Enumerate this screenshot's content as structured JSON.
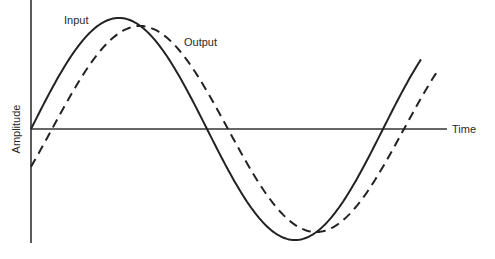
{
  "chart_data": {
    "type": "line",
    "title": "",
    "xlabel": "Time",
    "ylabel": "Amplitude",
    "grid": false,
    "legend": "inline labels",
    "series": [
      {
        "name": "Input",
        "style": "solid",
        "amplitude": 1.0,
        "phase_shift": 0.0,
        "x_deg": [
          0,
          90,
          180,
          270,
          450
        ],
        "y": [
          0,
          1,
          0,
          -1,
          0.67
        ]
      },
      {
        "name": "Output",
        "style": "dashed",
        "amplitude": 0.93,
        "phase_shift_deg": 21,
        "x_deg": [
          0,
          111,
          201,
          291,
          468
        ],
        "y": [
          -0.33,
          0.93,
          0,
          -0.93,
          0.6
        ]
      }
    ],
    "annotations": [
      "Input",
      "Output"
    ]
  },
  "labels": {
    "input": "Input",
    "output": "Output",
    "time": "Time",
    "amplitude": "Amplitude"
  }
}
